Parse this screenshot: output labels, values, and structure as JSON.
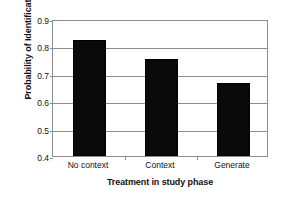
{
  "chart_data": {
    "type": "bar",
    "title": "",
    "categories": [
      "No context",
      "Context",
      "Generate"
    ],
    "values": [
      0.823,
      0.753,
      0.668
    ],
    "xlabel": "Treatment in study phase",
    "ylabel": "Probability of Identification",
    "ylim": [
      0.4,
      0.9
    ],
    "ytick_labels": [
      "0.9",
      "0.8",
      "0.7",
      "0.6",
      "0.5",
      "0.4"
    ],
    "ytick_values": [
      0.9,
      0.8,
      0.7,
      0.6,
      0.5,
      0.4
    ],
    "gridlines": [
      0.8,
      0.7,
      0.6,
      0.5
    ],
    "grid": true,
    "legend": "none",
    "bar_color": "#0a0a0a",
    "axis_color": "#8d8d8d"
  }
}
